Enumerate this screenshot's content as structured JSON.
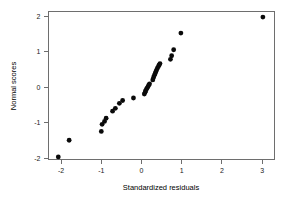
{
  "chart_data": {
    "type": "scatter",
    "title": "",
    "subtitle": "",
    "xlabel": "Standardized residuals",
    "ylabel": "Normal scores",
    "xlim": [
      -2.3,
      3.35
    ],
    "ylim": [
      -2.15,
      2.25
    ],
    "xticks": [
      -2,
      -1,
      0,
      1,
      2,
      3
    ],
    "xtick_labels": [
      "-2",
      "-1",
      "0",
      "1",
      "2",
      "3"
    ],
    "yticks": [
      -2,
      -1,
      0,
      1,
      2
    ],
    "ytick_labels": [
      "-2",
      "-1",
      "0",
      "1",
      "2"
    ],
    "grid": false,
    "legend": null,
    "legend_position": "none",
    "annotations": [],
    "point_color": "#0a0a0a",
    "point_size": 2.4,
    "series": [
      {
        "name": "Normal Q-Q",
        "x": [
          -2.07,
          -1.8,
          -1.0,
          -0.98,
          -0.92,
          -0.88,
          -0.72,
          -0.65,
          -0.55,
          -0.47,
          -0.2,
          0.07,
          0.09,
          0.1,
          0.12,
          0.14,
          0.16,
          0.18,
          0.2,
          0.28,
          0.3,
          0.32,
          0.34,
          0.36,
          0.38,
          0.4,
          0.42,
          0.44,
          0.46,
          0.72,
          0.75,
          0.8,
          0.98,
          3.02
        ],
        "y": [
          -1.97,
          -1.5,
          -1.25,
          -1.05,
          -0.97,
          -0.88,
          -0.68,
          -0.6,
          -0.46,
          -0.38,
          -0.31,
          -0.2,
          -0.15,
          -0.11,
          -0.07,
          -0.03,
          0.01,
          0.05,
          0.09,
          0.2,
          0.27,
          0.33,
          0.38,
          0.44,
          0.49,
          0.54,
          0.58,
          0.62,
          0.66,
          0.78,
          0.88,
          1.05,
          1.52,
          1.97
        ]
      }
    ]
  },
  "axes": {
    "x_axis_name": "standardized-residuals-axis",
    "y_axis_name": "normal-scores-axis"
  }
}
